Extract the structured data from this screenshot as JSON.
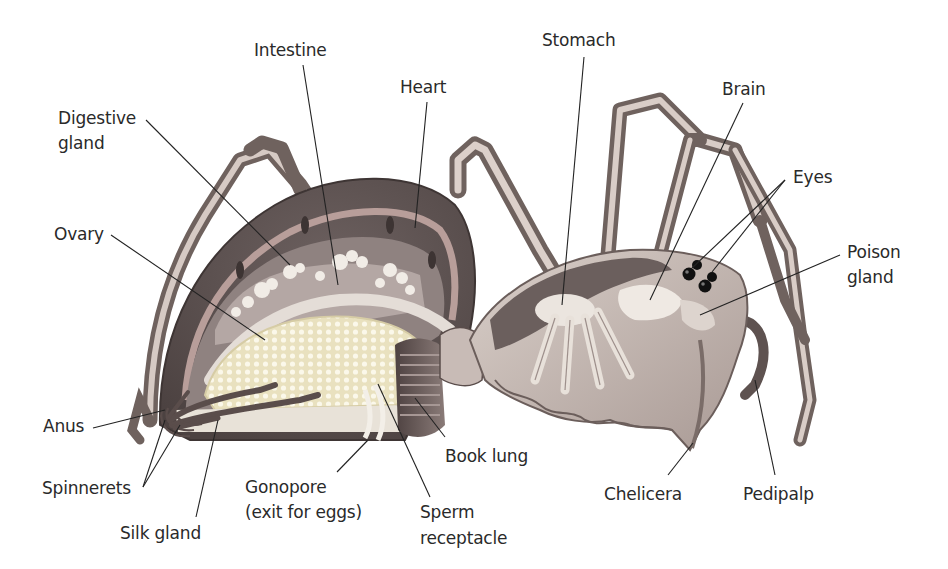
{
  "figure": {
    "colors": {
      "background": "#ffffff",
      "label_text": "#2a2a2a",
      "leader_line": "#222222",
      "exoskeleton_dark": "#5e5352",
      "exoskeleton_mid": "#8d7f7d",
      "heart_band": "#b89e9a",
      "leg_light": "#cbbdb7",
      "leg_dark": "#7d6e6a",
      "ovary": "#efe7c5",
      "gut_light": "#e7e0d8",
      "book_lung": "#6e5f5d",
      "eye": "#111111"
    }
  },
  "labels": {
    "intestine": "Intestine",
    "heart": "Heart",
    "digestive_gland_1": "Digestive",
    "digestive_gland_2": "gland",
    "ovary": "Ovary",
    "stomach": "Stomach",
    "brain": "Brain",
    "eyes": "Eyes",
    "poison_gland_1": "Poison",
    "poison_gland_2": "gland",
    "anus": "Anus",
    "spinnerets": "Spinnerets",
    "silk_gland": "Silk gland",
    "gonopore_1": "Gonopore",
    "gonopore_2": "(exit for eggs)",
    "sperm_receptacle_1": "Sperm",
    "sperm_receptacle_2": "receptacle",
    "book_lung": "Book lung",
    "chelicera": "Chelicera",
    "pedipalp": "Pedipalp"
  }
}
